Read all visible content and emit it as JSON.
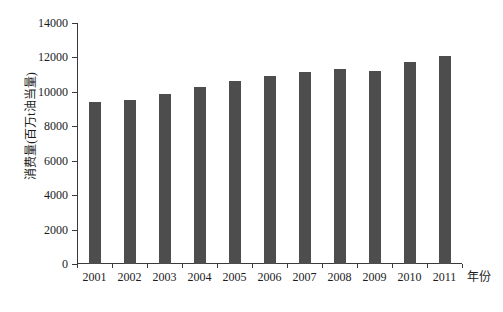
{
  "chart_data": {
    "type": "bar",
    "title": "",
    "categories": [
      "2001",
      "2002",
      "2003",
      "2004",
      "2005",
      "2006",
      "2007",
      "2008",
      "2009",
      "2010",
      "2011"
    ],
    "values": [
      9400,
      9550,
      9900,
      10300,
      10650,
      10900,
      11150,
      11300,
      11200,
      11750,
      12100
    ],
    "xlabel": "年份",
    "ylabel": "消费量(百万t油当量)",
    "ylim": [
      0,
      14000
    ],
    "ytick_step": 2000,
    "yticks": [
      "0",
      "2000",
      "4000",
      "6000",
      "8000",
      "10000",
      "12000",
      "14000"
    ],
    "grid": false,
    "legend": "none",
    "bar_color": "#4d4d4d",
    "axis_color": "#3a3a3a",
    "text_color": "#1c1c1c",
    "background_color": "#ffffff"
  }
}
